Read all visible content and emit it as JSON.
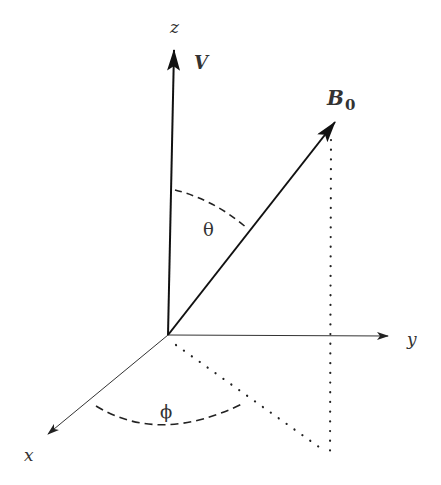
{
  "diagram": {
    "type": "3d-coordinate-vector-diagram",
    "axes": {
      "x": {
        "label": "x"
      },
      "y": {
        "label": "y"
      },
      "z": {
        "label": "z"
      }
    },
    "vectors": [
      {
        "name": "velocity",
        "label": "V",
        "direction": "along z-axis"
      },
      {
        "name": "magnetic-field",
        "label": "B",
        "subscript": "0",
        "direction": "polar angle theta from z, azimuth phi from x"
      }
    ],
    "angles": [
      {
        "name": "polar-angle",
        "symbol": "θ",
        "between": "z-axis and B0"
      },
      {
        "name": "azimuthal-angle",
        "symbol": "ϕ",
        "between": "x-axis and projection of B0 on xy-plane"
      }
    ],
    "colors": {
      "stroke": "#222222",
      "text": "#333333",
      "background": "#ffffff"
    }
  }
}
